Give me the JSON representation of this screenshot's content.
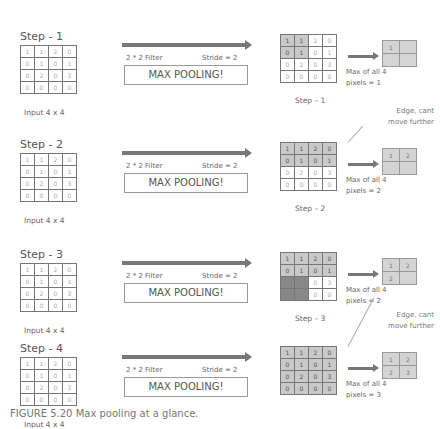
{
  "input_matrix": [
    [
      1,
      1,
      2,
      0
    ],
    [
      0,
      1,
      0,
      1
    ],
    [
      0,
      2,
      0,
      3
    ],
    [
      0,
      0,
      0,
      0
    ]
  ],
  "input_label": "Input 4 x 4",
  "filter_label": "2 * 2 Filter",
  "stride_label": "Stride = 2",
  "operation_label": "MAX POOLING!",
  "edge_note_line1": "Edge,      cant",
  "edge_note_line2": "move further",
  "steps": [
    {
      "title": "Step - 1",
      "caption": "Step – 1",
      "output": [
        "1",
        "",
        "",
        ""
      ],
      "note_line1": "Max  of  all  4",
      "note_line2": "pixels = 1"
    },
    {
      "title": "Step - 2",
      "caption": "Step – 2",
      "output": [
        "1",
        "2",
        "",
        ""
      ],
      "note_line1": "Max  of  all  4",
      "note_line2": "pixels = 2"
    },
    {
      "title": "Step - 3",
      "caption": "Step – 3",
      "output": [
        "1",
        "2",
        "2",
        ""
      ],
      "note_line1": "Max  of  all  4",
      "note_line2": "pixels = 2"
    },
    {
      "title": "Step - 4",
      "caption": "",
      "output": [
        "1",
        "2",
        "2",
        "3"
      ],
      "note_line1": "Max  of  all  4",
      "note_line2": "pixels = 3"
    }
  ],
  "figure_caption": "FIGURE 5.20    Max pooling at a glance."
}
